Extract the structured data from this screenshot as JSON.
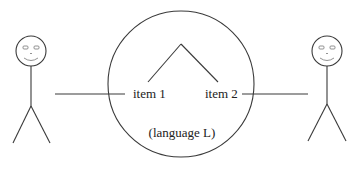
{
  "diagram": {
    "type": "communication-diagram",
    "language_circle": {
      "label": "(language L)",
      "tree": {
        "leaves": [
          {
            "label": "item 1"
          },
          {
            "label": "item 2"
          }
        ]
      }
    },
    "participants": [
      {
        "name": "left-person",
        "connected_to": "item 1"
      },
      {
        "name": "right-person",
        "connected_to": "item 2"
      }
    ]
  },
  "colors": {
    "line": "#3a3a3a",
    "text": "#222222",
    "background": "#ffffff"
  }
}
